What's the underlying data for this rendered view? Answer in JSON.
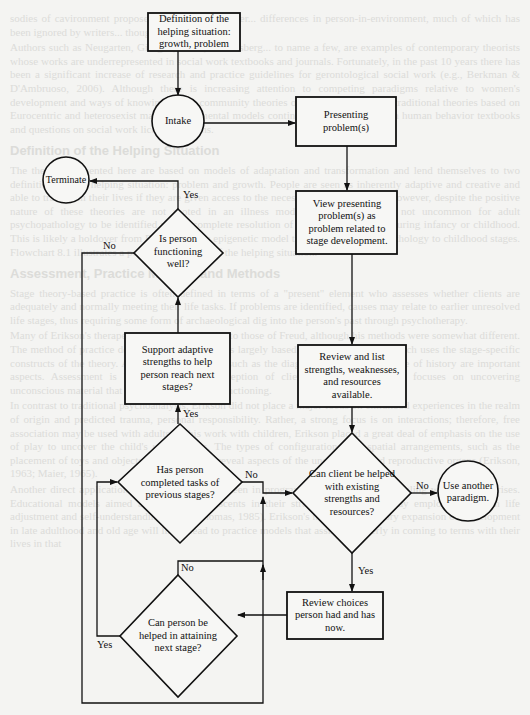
{
  "figure": {
    "nodes": {
      "definition": "Definition of the helping situation: growth, problem",
      "intake": "Intake",
      "presenting": "Presenting problem(s)",
      "view": "View presenting problem(s) as problem related to stage development.",
      "terminate": "Terminate",
      "functioning": "Is person functioning well?",
      "support": "Support adaptive strengths to help person reach next stages?",
      "review_list": "Review and list strengths, weaknesses, and resources available.",
      "completed": "Has person completed tasks of previous stages?",
      "can_client": "Can client be helped with existing strengths and resources?",
      "another": "Use another paradigm.",
      "review_choices": "Review choices person had and has now.",
      "can_person": "Can person be helped in attaining next stage?"
    },
    "edge_labels": {
      "functioning_yes": "Yes",
      "functioning_no": "No",
      "completed_yes": "Yes",
      "completed_no": "No",
      "can_client_no": "No",
      "can_client_yes": "Yes",
      "can_person_no": "No",
      "can_person_yes": "Yes"
    },
    "colors": {
      "line": "#111111",
      "page": "#f4f4f2",
      "bleed_text": "#c9c9c6"
    }
  },
  "background_bleed": {
    "paragraphs": [
      "sodies of cavironment proposed by Erikson also Ler... differences in person-in-environment, much of which has been ignored by writers... thought.",
      "Authors such as Neugarten, Gilligan, Rossi, Schlossberg... to name a few, are examples of contemporary theorists whose works are underrepresented in social work textbooks and journals. Fortunately, in the past 10 years there has been a significant increase of research and practice guidelines for gerontological social work (e.g., Berkman & D'Ambruoso, 2006). Although there is increasing attention to competing paradigms relative to women's development and ways of knowing and to community theories of Black development, traditional theories based on Eurocentric and heterosexist male developmental models continue to predominate both human behavior textbooks and questions on social work licensing exams."
    ],
    "heading1": "Definition of the Helping Situation",
    "paragraphs2": [
      "The theories presented here are based on models of adaptation and transformation and lend themselves to two definitions of the helping situation: problem and growth. People are seen as inherently adaptive and creative and able to transform their lives if they are given access to the necessary social supports. However, despite the positive nature of these theories are not rooted in an illness model of behavior, it is not uncommon for adult psychopathology to be identified with incomplete resolution of intrapsychic conflict during infancy or childhood. This is likely a holdover from Erikson's early epigenetic model that tied such psychopathology to childhood stages. Flowchart 8.1 illustrates a possible mind map of the helping situation."
    ],
    "heading2": "Assessment, Practice Models, and Methods",
    "paragraphs3": [
      "Stage theory-based practice is often defined in terms of a \"present\" element who assesses whether clients are adequately and normally meeting their life tasks. If problems are identified, causes may relate to earlier unresolved life stages, thus requiring some form of archaeological dig into the person's past through psychotherapy.",
      "Many of Erikson's therapeutic goals were similar to those of Freud, although his methods were somewhat different. The method of practice derived from his theory is largely based on ego psychology, which uses the stage-specific constructs of the theory. Assessment techniques such as the diagnostic interview and use of history are important aspects. Assessment is based on present perception of client and treatment often focuses on uncovering unconscious material that impedes healthy ego functioning.",
      "In contrast to traditional psychoanalysis, Erikson did not place a major focus on childhood experiences in the realm of origin and predicted trauma, personal responsibility. Rather, a strong focus is on interactions; therefore, free association may be used with adults. In his work with children, Erikson placed a great deal of emphasis on the use of play to uncover the child's unconscious. The types of configurations and spatial arrangements, such as the placement of toys and objects, are believed to reveal aspects of the unconscious and reproductive organs (Erikson, 1963; Maier, 1965).",
      "Another direct application of his theory can be seen in programs for adolescents struggling with identity crises. Educational models aimed at assisting adolescents in their struggle for identity may employ courses in life adjustment and self-understanding (R. M. Thomas, 1985). Erikson's most current theory expansion on development in late adulthood and old age will likely lead to practice models that assist the elderly in coming to terms with their lives in that"
    ]
  }
}
